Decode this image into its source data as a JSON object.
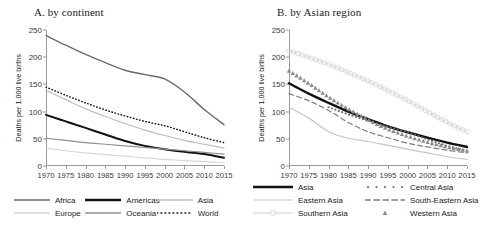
{
  "figure": {
    "width": 485,
    "height": 225,
    "background": "#ffffff"
  },
  "panels": [
    {
      "id": "a",
      "title": "A. by continent"
    },
    {
      "id": "b",
      "title": "B. by Asian region"
    }
  ],
  "axis": {
    "ylabel": "Deaths per 1,000 live births",
    "yticks": [
      0,
      50,
      100,
      150,
      200,
      250
    ],
    "ylim": [
      0,
      250
    ],
    "xticks": [
      1970,
      1975,
      1980,
      1985,
      1990,
      1995,
      2000,
      2005,
      2010,
      2015
    ],
    "xlim": [
      1970,
      2015
    ],
    "xticklabels": [
      "1970",
      "1975",
      "1980",
      "1985",
      "1990",
      "1995",
      "2000",
      "2005",
      "2010",
      "2015"
    ],
    "yticklabels": [
      "0",
      "50",
      "100",
      "150",
      "200",
      "250"
    ]
  },
  "colors": {
    "black": "#111111",
    "dark_gray": "#6b6b6b",
    "mid_gray": "#8f8f8f",
    "light_gray": "#bdbdbd",
    "pale_gray": "#d6d6d6",
    "axis": "#9a9a9a"
  },
  "legend_a": {
    "rows": [
      [
        {
          "label": "Africa",
          "key": "solid-dark-gray"
        },
        {
          "label": "Americas",
          "key": "solid-thick-black"
        },
        {
          "label": "Asia",
          "key": "solid-light-gray"
        }
      ],
      [
        {
          "label": "Europe",
          "key": "solid-pale-gray"
        },
        {
          "label": "Oceania",
          "key": "solid-mid-gray"
        },
        {
          "label": "World",
          "key": "dotted-black"
        }
      ]
    ]
  },
  "legend_b": {
    "rows": [
      [
        {
          "label": "Asia",
          "key": "solid-thick-black"
        },
        {
          "label": "Central Asia",
          "key": "dotted-marker-gray"
        }
      ],
      [
        {
          "label": "Eastern Asia",
          "key": "solid-thin-light-gray"
        },
        {
          "label": "South-Eastern Asia",
          "key": "dashed-gray"
        }
      ],
      [
        {
          "label": "Southern Asia",
          "key": "line-circle-marker"
        },
        {
          "label": "Western Asia",
          "key": "triangle-marker"
        }
      ]
    ]
  },
  "chart_data": [
    {
      "type": "line",
      "title": "A. by continent",
      "xlabel": "",
      "ylabel": "Deaths per 1,000 live births",
      "xlim": [
        1970,
        2015
      ],
      "ylim": [
        0,
        250
      ],
      "grid": false,
      "legend_position": "bottom",
      "x": [
        1970,
        1975,
        1980,
        1985,
        1990,
        1995,
        2000,
        2005,
        2010,
        2015
      ],
      "series": [
        {
          "name": "Africa",
          "style": "solid",
          "color": "#6b6b6b",
          "width": 1.4,
          "values": [
            240,
            222,
            205,
            190,
            176,
            168,
            160,
            136,
            104,
            76
          ]
        },
        {
          "name": "Americas",
          "style": "solid",
          "color": "#111111",
          "width": 2.0,
          "values": [
            94,
            82,
            70,
            58,
            46,
            37,
            31,
            26,
            22,
            15
          ]
        },
        {
          "name": "Asia",
          "style": "solid",
          "color": "#bdbdbd",
          "width": 1.2,
          "values": [
            139,
            122,
            105,
            91,
            78,
            66,
            56,
            47,
            40,
            33
          ]
        },
        {
          "name": "Europe",
          "style": "solid",
          "color": "#d6d6d6",
          "width": 1.2,
          "values": [
            33,
            28,
            24,
            21,
            18,
            15,
            12,
            10,
            8,
            6
          ]
        },
        {
          "name": "Oceania",
          "style": "solid",
          "color": "#8f8f8f",
          "width": 1.2,
          "values": [
            51,
            47,
            43,
            40,
            37,
            34,
            31,
            28,
            25,
            22
          ]
        },
        {
          "name": "World",
          "style": "dotted",
          "color": "#111111",
          "width": 1.4,
          "values": [
            145,
            130,
            116,
            103,
            92,
            82,
            74,
            63,
            52,
            43
          ]
        }
      ]
    },
    {
      "type": "line",
      "title": "B. by Asian region",
      "xlabel": "",
      "ylabel": "Deaths per 1,000 live births",
      "xlim": [
        1970,
        2015
      ],
      "ylim": [
        0,
        250
      ],
      "grid": false,
      "legend_position": "bottom",
      "x": [
        1970,
        1975,
        1980,
        1985,
        1990,
        1995,
        2000,
        2005,
        2010,
        2015
      ],
      "series": [
        {
          "name": "Asia",
          "style": "solid",
          "color": "#111111",
          "width": 2.4,
          "values": [
            152,
            133,
            116,
            100,
            86,
            73,
            62,
            52,
            43,
            35
          ]
        },
        {
          "name": "Central Asia",
          "style": "dotted-marker",
          "color": "#6b6b6b",
          "width": 1.2,
          "values": [
            null,
            null,
            108,
            95,
            83,
            72,
            62,
            49,
            37,
            28
          ]
        },
        {
          "name": "Eastern Asia",
          "style": "solid",
          "color": "#c4c4c4",
          "width": 1.2,
          "values": [
            108,
            88,
            63,
            51,
            45,
            38,
            31,
            24,
            17,
            12
          ]
        },
        {
          "name": "South-Eastern Asia",
          "style": "dashed",
          "color": "#7d7d7d",
          "width": 1.2,
          "values": [
            133,
            120,
            102,
            80,
            63,
            52,
            42,
            35,
            29,
            24
          ]
        },
        {
          "name": "Southern Asia",
          "style": "circle-marker",
          "color": "#cfcfcf",
          "width": 1.2,
          "values": [
            212,
            200,
            187,
            172,
            156,
            139,
            120,
            100,
            80,
            63
          ]
        },
        {
          "name": "Western Asia",
          "style": "triangle-marker",
          "color": "#8a8a8a",
          "width": 1.2,
          "values": [
            175,
            152,
            127,
            105,
            85,
            68,
            55,
            44,
            35,
            28
          ]
        }
      ]
    }
  ]
}
